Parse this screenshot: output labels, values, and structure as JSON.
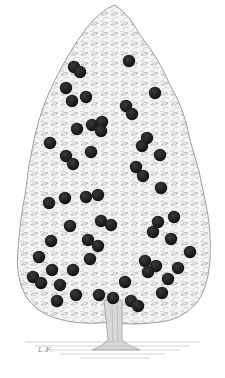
{
  "image": {
    "subject": "engraving of a fruit tree bearing dark round fruits",
    "background_color": "#ffffff",
    "foliage_color": "#c8c8c8",
    "fruit_color": "#1e1e1e",
    "signature": "L.F."
  },
  "fruits": [
    [
      74,
      67
    ],
    [
      80,
      72
    ],
    [
      129,
      61
    ],
    [
      66,
      88
    ],
    [
      72,
      101
    ],
    [
      86,
      97
    ],
    [
      155,
      93
    ],
    [
      126,
      106
    ],
    [
      132,
      114
    ],
    [
      77,
      129
    ],
    [
      92,
      125
    ],
    [
      102,
      122
    ],
    [
      101,
      131
    ],
    [
      50,
      143
    ],
    [
      91,
      152
    ],
    [
      147,
      138
    ],
    [
      142,
      146
    ],
    [
      160,
      155
    ],
    [
      66,
      156
    ],
    [
      73,
      164
    ],
    [
      136,
      167
    ],
    [
      143,
      176
    ],
    [
      161,
      188
    ],
    [
      49,
      203
    ],
    [
      65,
      198
    ],
    [
      86,
      197
    ],
    [
      98,
      195
    ],
    [
      70,
      226
    ],
    [
      101,
      221
    ],
    [
      111,
      225
    ],
    [
      174,
      217
    ],
    [
      158,
      222
    ],
    [
      153,
      232
    ],
    [
      51,
      241
    ],
    [
      88,
      240
    ],
    [
      98,
      246
    ],
    [
      171,
      239
    ],
    [
      39,
      257
    ],
    [
      90,
      259
    ],
    [
      190,
      252
    ],
    [
      145,
      261
    ],
    [
      156,
      266
    ],
    [
      148,
      272
    ],
    [
      52,
      270
    ],
    [
      73,
      270
    ],
    [
      178,
      268
    ],
    [
      33,
      277
    ],
    [
      41,
      283
    ],
    [
      168,
      279
    ],
    [
      60,
      285
    ],
    [
      125,
      282
    ],
    [
      76,
      295
    ],
    [
      99,
      295
    ],
    [
      57,
      301
    ],
    [
      113,
      298
    ],
    [
      131,
      301
    ],
    [
      138,
      306
    ],
    [
      162,
      293
    ]
  ]
}
